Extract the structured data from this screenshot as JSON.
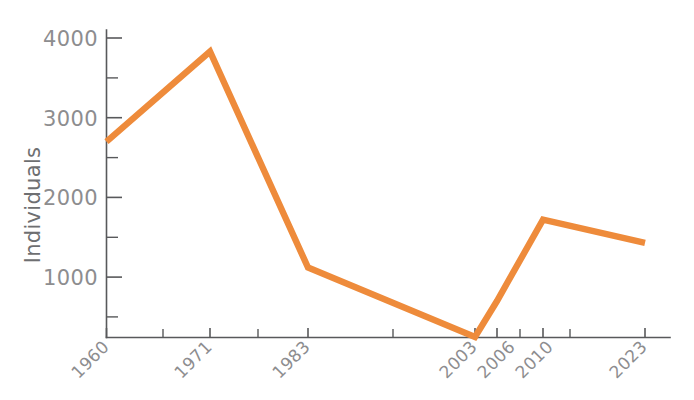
{
  "chart_data": {
    "type": "line",
    "title": "",
    "subtitle": "",
    "xlabel": "",
    "ylabel": "Individuals",
    "categories": [
      "1960",
      "1971",
      "1983",
      "2003",
      "2006",
      "2010",
      "2023"
    ],
    "x": [
      1960,
      1971,
      1983,
      2003,
      2006,
      2010,
      2023
    ],
    "values": [
      2700,
      3830,
      1120,
      250,
      700,
      1720,
      1430
    ],
    "series": [
      {
        "name": "Individuals",
        "color": "#ee8b3b",
        "values": [
          2700,
          3830,
          1120,
          250,
          700,
          1720,
          1430
        ]
      }
    ],
    "ylim": [
      250,
      4100
    ],
    "xlim": [
      1960,
      2023
    ],
    "ytick_labels": [
      "1000",
      "2000",
      "3000",
      "4000"
    ],
    "ytick_values": [
      1000,
      2000,
      3000,
      4000
    ],
    "yminor_values": [
      500,
      1500,
      2500,
      3500
    ],
    "xtick_labels": [
      "1960",
      "1971",
      "1983",
      "2003",
      "2006",
      "2010",
      "2023"
    ],
    "xminor_ticks": [
      "1967",
      "1975",
      "1990",
      "2008",
      "2013"
    ],
    "grid": false,
    "legend": false,
    "legend_position": "none",
    "line_width_px": 6.4,
    "background_color": "#ffffff",
    "axis_color": "#58595b",
    "tick_label_color": "#8d8d8f",
    "axis_title_color": "#6e6f71",
    "xtick_label_rotation_deg": -45
  },
  "axis": {
    "y_title": "Individuals"
  }
}
